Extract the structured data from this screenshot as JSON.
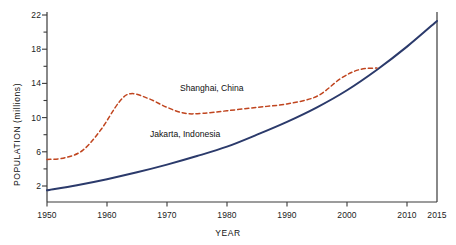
{
  "chart_data": {
    "type": "line",
    "title": "",
    "xlabel": "YEAR",
    "ylabel": "POPULATION (millions)",
    "xlim": [
      1950,
      2015
    ],
    "ylim": [
      0,
      22.8
    ],
    "grid": false,
    "legend_position": "inline-annotations",
    "x_ticks": [
      1950,
      1960,
      1970,
      1980,
      1990,
      2000,
      2010,
      2015
    ],
    "x_tick_labels": [
      "1950",
      "1960",
      "1970",
      "1980",
      "1990",
      "2000",
      "2010",
      "2015"
    ],
    "y_ticks": [
      2,
      6,
      10,
      14,
      18,
      22
    ],
    "y_tick_labels": [
      "2",
      "6",
      "10",
      "14",
      "18",
      "22"
    ],
    "y_minor_ticks": [
      4,
      8,
      12,
      16,
      20
    ],
    "series": [
      {
        "name": "Jakarta, Indonesia",
        "color": "#2b3a6b",
        "style": "solid",
        "x": [
          1950,
          1955,
          1960,
          1965,
          1970,
          1975,
          1980,
          1985,
          1990,
          1995,
          2000,
          2005,
          2010,
          2015
        ],
        "values": [
          1.5,
          2.1,
          2.8,
          3.6,
          4.5,
          5.5,
          6.6,
          8.0,
          9.5,
          11.2,
          13.2,
          15.6,
          18.3,
          21.3
        ]
      },
      {
        "name": "Shanghai, China",
        "color": "#c0451f",
        "style": "dashed",
        "x": [
          1950,
          1953,
          1956,
          1959,
          1962,
          1964,
          1967,
          1970,
          1973,
          1976,
          1980,
          1985,
          1990,
          1995,
          1999,
          2002,
          2005
        ],
        "values": [
          5.1,
          5.3,
          6.2,
          8.6,
          11.8,
          12.8,
          12.2,
          11.2,
          10.5,
          10.5,
          10.8,
          11.2,
          11.6,
          12.5,
          14.6,
          15.6,
          15.8
        ]
      }
    ],
    "annotations": [
      {
        "text": "Shanghai, China",
        "x": 1972,
        "y": 13.9
      },
      {
        "text": "Jakarta, Indonesia",
        "x": 1967,
        "y": 8.6
      }
    ]
  },
  "axes": {
    "x_title": "YEAR",
    "y_title": "POPULATION (millions)"
  },
  "labels": {
    "shanghai": "Shanghai, China",
    "jakarta": "Jakarta, Indonesia"
  },
  "colors": {
    "shanghai": "#c0451f",
    "jakarta": "#2b3a6b",
    "axis": "#3a3a3a",
    "background": "#ffffff"
  }
}
